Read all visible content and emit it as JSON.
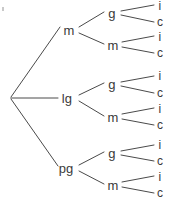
{
  "diagram": {
    "type": "tree",
    "background_color": "#ffffff",
    "line_color": "#4a4a4a",
    "text_color": "#3a3a3a",
    "root": {
      "id": "root",
      "label": "",
      "x": 10,
      "y": 98
    },
    "level1": [
      {
        "id": "n-m",
        "label": "m",
        "x": 69,
        "y": 30
      },
      {
        "id": "n-lg",
        "label": "lg",
        "x": 67,
        "y": 98
      },
      {
        "id": "n-pg",
        "label": "pg",
        "x": 66,
        "y": 168
      }
    ],
    "level2": [
      {
        "id": "n-m-g",
        "label": "g",
        "x": 112,
        "y": 13,
        "parent": "n-m"
      },
      {
        "id": "n-m-m",
        "label": "m",
        "x": 113,
        "y": 45,
        "parent": "n-m"
      },
      {
        "id": "n-lg-g",
        "label": "g",
        "x": 112,
        "y": 84,
        "parent": "n-lg"
      },
      {
        "id": "n-lg-m",
        "label": "m",
        "x": 113,
        "y": 117,
        "parent": "n-lg"
      },
      {
        "id": "n-pg-g",
        "label": "g",
        "x": 112,
        "y": 153,
        "parent": "n-pg"
      },
      {
        "id": "n-pg-m",
        "label": "m",
        "x": 113,
        "y": 185,
        "parent": "n-pg"
      }
    ],
    "level3": [
      {
        "id": "l-1",
        "label": "i",
        "x": 160,
        "y": 6,
        "parent": "n-m-g"
      },
      {
        "id": "l-2",
        "label": "c",
        "x": 160,
        "y": 22,
        "parent": "n-m-g"
      },
      {
        "id": "l-3",
        "label": "i",
        "x": 160,
        "y": 37,
        "parent": "n-m-m"
      },
      {
        "id": "l-4",
        "label": "c",
        "x": 160,
        "y": 53,
        "parent": "n-m-m"
      },
      {
        "id": "l-5",
        "label": "i",
        "x": 160,
        "y": 76,
        "parent": "n-lg-g"
      },
      {
        "id": "l-6",
        "label": "c",
        "x": 160,
        "y": 93,
        "parent": "n-lg-g"
      },
      {
        "id": "l-7",
        "label": "i",
        "x": 160,
        "y": 109,
        "parent": "n-lg-m"
      },
      {
        "id": "l-8",
        "label": "c",
        "x": 160,
        "y": 125,
        "parent": "n-lg-m"
      },
      {
        "id": "l-9",
        "label": "i",
        "x": 160,
        "y": 145,
        "parent": "n-pg-g"
      },
      {
        "id": "l-10",
        "label": "c",
        "x": 160,
        "y": 161,
        "parent": "n-pg-g"
      },
      {
        "id": "l-11",
        "label": "i",
        "x": 160,
        "y": 177,
        "parent": "n-pg-m"
      },
      {
        "id": "l-12",
        "label": "c",
        "x": 160,
        "y": 193,
        "parent": "n-pg-m"
      }
    ],
    "edges": [
      {
        "id": "e-root-m",
        "x1": 11,
        "y1": 97,
        "x2": 60,
        "y2": 27
      },
      {
        "id": "e-root-lg",
        "x1": 11,
        "y1": 98,
        "x2": 58,
        "y2": 98
      },
      {
        "id": "e-root-pg",
        "x1": 11,
        "y1": 99,
        "x2": 58,
        "y2": 166
      },
      {
        "id": "e-m-g",
        "x1": 79,
        "y1": 27,
        "x2": 104,
        "y2": 12
      },
      {
        "id": "e-m-m",
        "x1": 79,
        "y1": 33,
        "x2": 104,
        "y2": 44
      },
      {
        "id": "e-lg-g",
        "x1": 79,
        "y1": 95,
        "x2": 104,
        "y2": 83
      },
      {
        "id": "e-lg-m",
        "x1": 79,
        "y1": 101,
        "x2": 104,
        "y2": 116
      },
      {
        "id": "e-pg-g",
        "x1": 79,
        "y1": 165,
        "x2": 104,
        "y2": 152
      },
      {
        "id": "e-pg-m",
        "x1": 79,
        "y1": 171,
        "x2": 104,
        "y2": 184
      },
      {
        "id": "e-mg-i",
        "x1": 121,
        "y1": 11,
        "x2": 154,
        "y2": 5
      },
      {
        "id": "e-mg-c",
        "x1": 121,
        "y1": 15,
        "x2": 154,
        "y2": 22
      },
      {
        "id": "e-mm-i",
        "x1": 122,
        "y1": 42,
        "x2": 154,
        "y2": 36
      },
      {
        "id": "e-mm-c",
        "x1": 122,
        "y1": 47,
        "x2": 154,
        "y2": 53
      },
      {
        "id": "e-lgg-i",
        "x1": 121,
        "y1": 82,
        "x2": 154,
        "y2": 76
      },
      {
        "id": "e-lgg-c",
        "x1": 121,
        "y1": 86,
        "x2": 154,
        "y2": 93
      },
      {
        "id": "e-lgm-i",
        "x1": 122,
        "y1": 114,
        "x2": 154,
        "y2": 108
      },
      {
        "id": "e-lgm-c",
        "x1": 122,
        "y1": 119,
        "x2": 154,
        "y2": 125
      },
      {
        "id": "e-pgg-i",
        "x1": 121,
        "y1": 151,
        "x2": 154,
        "y2": 145
      },
      {
        "id": "e-pgg-c",
        "x1": 121,
        "y1": 155,
        "x2": 154,
        "y2": 161
      },
      {
        "id": "e-pgm-i",
        "x1": 122,
        "y1": 182,
        "x2": 154,
        "y2": 176
      },
      {
        "id": "e-pgm-c",
        "x1": 122,
        "y1": 187,
        "x2": 154,
        "y2": 193
      }
    ],
    "artifact": {
      "id": "speck",
      "x": 2,
      "y": 7
    }
  }
}
